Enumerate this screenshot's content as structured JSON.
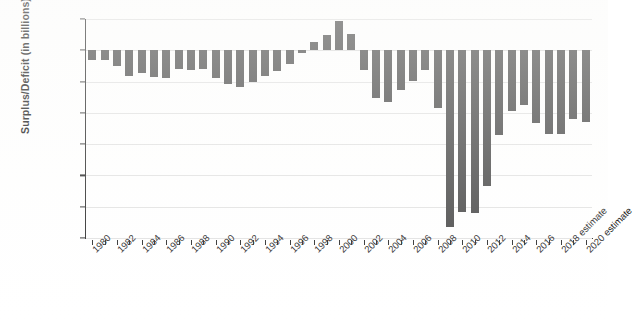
{
  "chart_data": {
    "type": "bar",
    "title": "",
    "subtitle": "",
    "xlabel": "",
    "ylabel": "Surplus/Deficit (in billions)",
    "ylim": [
      -1500,
      250
    ],
    "ytick_values": [
      250,
      0,
      -250,
      -500,
      -750,
      -1000,
      -1250,
      -1500
    ],
    "ytick_labels": [
      "$250",
      "$0",
      "$−250",
      "$−500",
      "$−750",
      "$−1,000",
      "$−1,250",
      "$−1,500"
    ],
    "grid": true,
    "legend": "none",
    "bar_color": "#494949",
    "axis_color": "#2b2b2b",
    "grid_color": "#e2e2e2",
    "categories": [
      "1980",
      "1981",
      "1982",
      "1983",
      "1984",
      "1985",
      "1986",
      "1987",
      "1988",
      "1989",
      "1990",
      "1991",
      "1992",
      "1993",
      "1994",
      "1995",
      "1996",
      "1997",
      "1998",
      "1999",
      "2000",
      "2001",
      "2002",
      "2003",
      "2004",
      "2005",
      "2006",
      "2007",
      "2008",
      "2009",
      "2010",
      "2011",
      "2012",
      "2013",
      "2014",
      "2015",
      "2016",
      "2017",
      "2018 estimate",
      "2019",
      "2020 estimate"
    ],
    "tick_labels": [
      "1980",
      "",
      "1982",
      "",
      "1984",
      "",
      "1986",
      "",
      "1988",
      "",
      "1990",
      "",
      "1992",
      "",
      "1994",
      "",
      "1996",
      "",
      "1998",
      "",
      "2000",
      "",
      "2002",
      "",
      "2004",
      "",
      "2006",
      "",
      "2008",
      "",
      "2010",
      "",
      "2012",
      "",
      "2014",
      "",
      "2016",
      "",
      "2018 estimate",
      "",
      "2020 estimate"
    ],
    "values": [
      -74,
      -79,
      -128,
      -208,
      -185,
      -212,
      -221,
      -150,
      -155,
      -153,
      -221,
      -269,
      -290,
      -255,
      -203,
      -164,
      -107,
      -22,
      69,
      126,
      236,
      128,
      -158,
      -378,
      -413,
      -318,
      -248,
      -161,
      -459,
      -1413,
      -1294,
      -1300,
      -1087,
      -680,
      -485,
      -438,
      -585,
      -665,
      -665,
      -550,
      -570
    ]
  }
}
